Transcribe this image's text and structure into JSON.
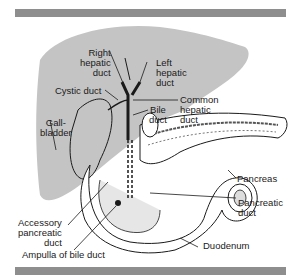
{
  "diagram": {
    "colors": {
      "liver": "#c4c4c4",
      "bar": "#8e8e8e",
      "line": "#1a1a1a",
      "organ": "#ffffff"
    },
    "labels": {
      "right_hepatic_duct": [
        "Right",
        "hepatic",
        "duct"
      ],
      "left_hepatic_duct": [
        "Left",
        "hepatic",
        "duct"
      ],
      "cystic_duct": "Cystic duct",
      "common_hepatic_duct": [
        "Common",
        "hepatic",
        "duct"
      ],
      "bile_duct": [
        "Bile",
        "duct"
      ],
      "gallbladder": [
        "Gall-",
        "bladder"
      ],
      "pancreas": "Pancreas",
      "pancreatic_duct": [
        "Pancreatic",
        "duct"
      ],
      "accessory_pancreatic_duct": [
        "Accessory",
        "pancreatic",
        "duct"
      ],
      "duodenum": "Duodenum",
      "ampulla_of_bile_duct": "Ampulla of bile duct"
    }
  }
}
